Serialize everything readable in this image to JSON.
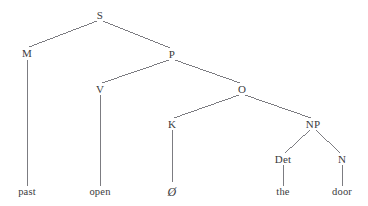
{
  "figure": {
    "name": "syntax-tree",
    "type": "constituency-tree",
    "background_color": "#ffffff",
    "line_color": "#6e6e73",
    "text_color": "#3a3a3c"
  },
  "tree": {
    "root": "S",
    "sentence": "past open Ø the door",
    "nodes": [
      {
        "id": "S",
        "label": "S",
        "x": 100,
        "y": 15,
        "kind": "nonterminal"
      },
      {
        "id": "M",
        "label": "M",
        "x": 27,
        "y": 53,
        "kind": "nonterminal"
      },
      {
        "id": "P",
        "label": "P",
        "x": 172,
        "y": 54,
        "kind": "nonterminal"
      },
      {
        "id": "V",
        "label": "V",
        "x": 100,
        "y": 89,
        "kind": "nonterminal"
      },
      {
        "id": "O",
        "label": "O",
        "x": 242,
        "y": 89,
        "kind": "nonterminal"
      },
      {
        "id": "K",
        "label": "K",
        "x": 172,
        "y": 124,
        "kind": "nonterminal"
      },
      {
        "id": "NP",
        "label": "NP",
        "x": 313,
        "y": 124,
        "kind": "nonterminal"
      },
      {
        "id": "Det",
        "label": "Det",
        "x": 283,
        "y": 159,
        "kind": "nonterminal"
      },
      {
        "id": "N",
        "label": "N",
        "x": 342,
        "y": 159,
        "kind": "nonterminal"
      },
      {
        "id": "t1",
        "label": "past",
        "x": 27,
        "y": 192,
        "kind": "terminal"
      },
      {
        "id": "t2",
        "label": "open",
        "x": 100,
        "y": 192,
        "kind": "terminal"
      },
      {
        "id": "t3",
        "label": "Ø",
        "x": 172,
        "y": 192,
        "kind": "terminal-null"
      },
      {
        "id": "t4",
        "label": "the",
        "x": 283,
        "y": 192,
        "kind": "terminal"
      },
      {
        "id": "t5",
        "label": "door",
        "x": 342,
        "y": 192,
        "kind": "terminal"
      }
    ],
    "edges": [
      {
        "from": "S",
        "to": "M",
        "x1": 97,
        "y1": 21,
        "x2": 29,
        "y2": 47
      },
      {
        "from": "S",
        "to": "P",
        "x1": 103,
        "y1": 21,
        "x2": 170,
        "y2": 48
      },
      {
        "from": "M",
        "to": "t1",
        "x1": 27,
        "y1": 60,
        "x2": 27,
        "y2": 186
      },
      {
        "from": "P",
        "to": "V",
        "x1": 169,
        "y1": 60,
        "x2": 102,
        "y2": 83
      },
      {
        "from": "P",
        "to": "O",
        "x1": 175,
        "y1": 60,
        "x2": 240,
        "y2": 83
      },
      {
        "from": "V",
        "to": "t2",
        "x1": 100,
        "y1": 95,
        "x2": 100,
        "y2": 186
      },
      {
        "from": "O",
        "to": "K",
        "x1": 239,
        "y1": 95,
        "x2": 174,
        "y2": 118
      },
      {
        "from": "O",
        "to": "NP",
        "x1": 245,
        "y1": 95,
        "x2": 311,
        "y2": 118
      },
      {
        "from": "K",
        "to": "t3",
        "x1": 172,
        "y1": 130,
        "x2": 172,
        "y2": 182
      },
      {
        "from": "NP",
        "to": "Det",
        "x1": 310,
        "y1": 130,
        "x2": 285,
        "y2": 153
      },
      {
        "from": "NP",
        "to": "N",
        "x1": 316,
        "y1": 130,
        "x2": 340,
        "y2": 153
      },
      {
        "from": "Det",
        "to": "t4",
        "x1": 283,
        "y1": 165,
        "x2": 283,
        "y2": 186
      },
      {
        "from": "N",
        "to": "t5",
        "x1": 342,
        "y1": 165,
        "x2": 342,
        "y2": 186
      }
    ]
  }
}
